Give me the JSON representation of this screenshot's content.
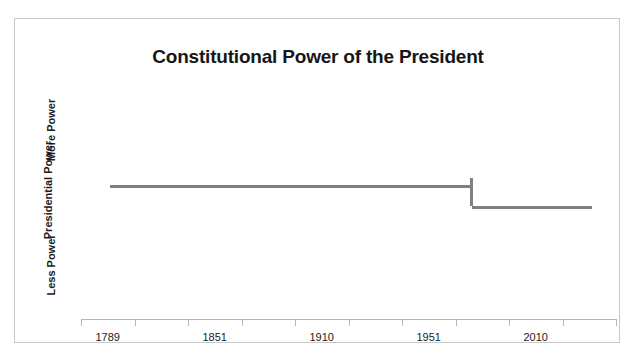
{
  "chart_data": {
    "type": "line",
    "title": "Constitutional Power of the President",
    "xlabel": "",
    "ylabel": "Presidential Power",
    "y_axis_labels": {
      "high": "More Power",
      "low": "Less Power"
    },
    "grid": false,
    "legend": "none",
    "xlim": [
      1789,
      2010
    ],
    "ylim": [
      0,
      1
    ],
    "tick_labels": [
      "1789",
      "1851",
      "1910",
      "1951",
      "2010"
    ],
    "tick_values": [
      1789,
      1851,
      1910,
      1951,
      2010
    ],
    "minor_tick_count": 9,
    "series": [
      {
        "name": "Constitutional Power of the President",
        "color": "#808080",
        "style": "step",
        "points": [
          {
            "x": 1789,
            "y": 0.62,
            "x_label": "1789",
            "y_label": "More Power"
          },
          {
            "x": 1951,
            "y": 0.62,
            "x_label": "1951",
            "y_label": "More Power"
          },
          {
            "x": 1951,
            "y": 0.52,
            "x_label": "1951",
            "y_label": "Less Power"
          },
          {
            "x": 2010,
            "y": 0.52,
            "x_label": "2010",
            "y_label": "Less Power"
          }
        ]
      }
    ],
    "annotations": []
  },
  "chart": {
    "title": "Constitutional Power of the President",
    "y_axis_title": "Presidential Power",
    "y_label_high": "More Power",
    "y_label_low": "Less Power",
    "x_tick_labels": [
      "1789",
      "1851",
      "1910",
      "1951",
      "2010"
    ],
    "colors": {
      "line": "#808080",
      "frame": "#c9c9c9",
      "axis": "#b6b6b6",
      "title_text": "#161616",
      "label_text": "#1b1b1b",
      "background": "#ffffff"
    }
  }
}
